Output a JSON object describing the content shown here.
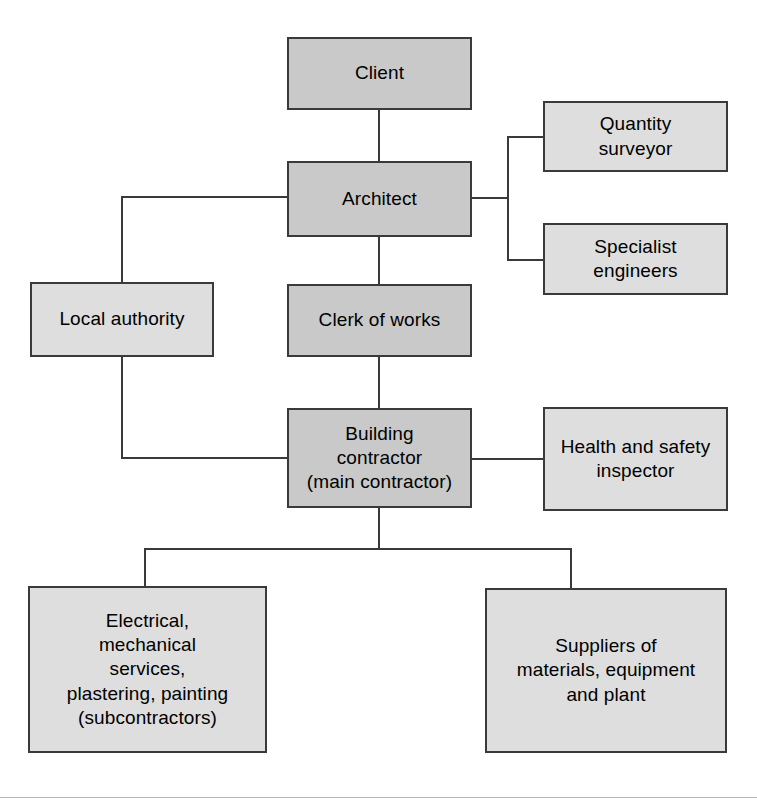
{
  "diagram": {
    "type": "organisation-chart",
    "colors": {
      "box_fill_primary": "#c9c9c9",
      "box_fill_secondary": "#dedede",
      "box_border": "#3a3a3a",
      "connector": "#3a3a3a",
      "background": "#ffffff",
      "footer_rule": "#b4b4b4"
    },
    "nodes": [
      {
        "id": "client",
        "label": "Client",
        "fill": "primary",
        "x": 287,
        "y": 37,
        "w": 185,
        "h": 73
      },
      {
        "id": "architect",
        "label": "Architect",
        "fill": "primary",
        "x": 287,
        "y": 161,
        "w": 185,
        "h": 76
      },
      {
        "id": "quantity-surveyor",
        "label": "Quantity\nsurveyor",
        "fill": "secondary",
        "x": 543,
        "y": 101,
        "w": 185,
        "h": 71
      },
      {
        "id": "specialist-engineers",
        "label": "Specialist\nengineers",
        "fill": "secondary",
        "x": 543,
        "y": 223,
        "w": 185,
        "h": 72
      },
      {
        "id": "local-authority",
        "label": "Local authority",
        "fill": "secondary",
        "x": 30,
        "y": 282,
        "w": 184,
        "h": 75
      },
      {
        "id": "clerk-of-works",
        "label": "Clerk of works",
        "fill": "primary",
        "x": 287,
        "y": 284,
        "w": 185,
        "h": 73
      },
      {
        "id": "building-contractor",
        "label": "Building\ncontractor\n(main contractor)",
        "fill": "primary",
        "x": 287,
        "y": 408,
        "w": 185,
        "h": 100
      },
      {
        "id": "health-safety-inspector",
        "label": "Health and safety\ninspector",
        "fill": "secondary",
        "x": 543,
        "y": 407,
        "w": 185,
        "h": 104
      },
      {
        "id": "subcontractors",
        "label": "Electrical,\nmechanical\nservices,\nplastering, painting\n(subcontractors)",
        "fill": "secondary",
        "x": 28,
        "y": 586,
        "w": 239,
        "h": 167
      },
      {
        "id": "suppliers",
        "label": "Suppliers of\nmaterials, equipment\nand plant",
        "fill": "secondary",
        "x": 485,
        "y": 588,
        "w": 242,
        "h": 165
      }
    ],
    "connectors": [
      {
        "id": "client-to-architect",
        "orient": "v",
        "x": 378,
        "y": 110,
        "len": 51
      },
      {
        "id": "architect-to-clerk",
        "orient": "v",
        "x": 378,
        "y": 237,
        "len": 47
      },
      {
        "id": "clerk-to-contractor",
        "orient": "v",
        "x": 378,
        "y": 357,
        "len": 51
      },
      {
        "id": "architect-left-stub",
        "orient": "h",
        "x": 121,
        "y": 196,
        "len": 166
      },
      {
        "id": "architect-to-local-authority-drop",
        "orient": "v",
        "x": 121,
        "y": 196,
        "len": 86
      },
      {
        "id": "local-authority-drop",
        "orient": "v",
        "x": 121,
        "y": 357,
        "len": 102
      },
      {
        "id": "local-authority-to-contractor",
        "orient": "h",
        "x": 121,
        "y": 457,
        "len": 166
      },
      {
        "id": "architect-right-stub",
        "orient": "h",
        "x": 470,
        "y": 197,
        "len": 39
      },
      {
        "id": "architect-right-riser",
        "orient": "v",
        "x": 507,
        "y": 136,
        "len": 125
      },
      {
        "id": "to-quantity-surveyor",
        "orient": "h",
        "x": 507,
        "y": 136,
        "len": 38
      },
      {
        "id": "to-specialist-engineers",
        "orient": "h",
        "x": 507,
        "y": 259,
        "len": 38
      },
      {
        "id": "contractor-to-inspector",
        "orient": "h",
        "x": 470,
        "y": 458,
        "len": 75
      },
      {
        "id": "contractor-down-to-bus",
        "orient": "v",
        "x": 378,
        "y": 508,
        "len": 42
      },
      {
        "id": "bottom-bus",
        "orient": "h",
        "x": 144,
        "y": 548,
        "len": 428
      },
      {
        "id": "bus-to-subcontractors",
        "orient": "v",
        "x": 144,
        "y": 548,
        "len": 40
      },
      {
        "id": "bus-to-suppliers",
        "orient": "v",
        "x": 570,
        "y": 548,
        "len": 42
      }
    ],
    "footer_rule": {
      "y": 797
    }
  }
}
